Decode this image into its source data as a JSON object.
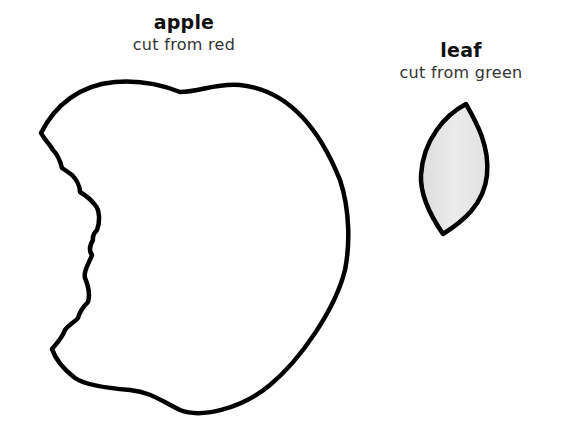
{
  "apple": {
    "title": "apple",
    "instruction": "cut from red",
    "outline_color": "#000000",
    "fill_color": "#ffffff"
  },
  "leaf": {
    "title": "leaf",
    "instruction": "cut from green",
    "outline_color": "#000000",
    "fill_color": "#e6e6e6"
  }
}
